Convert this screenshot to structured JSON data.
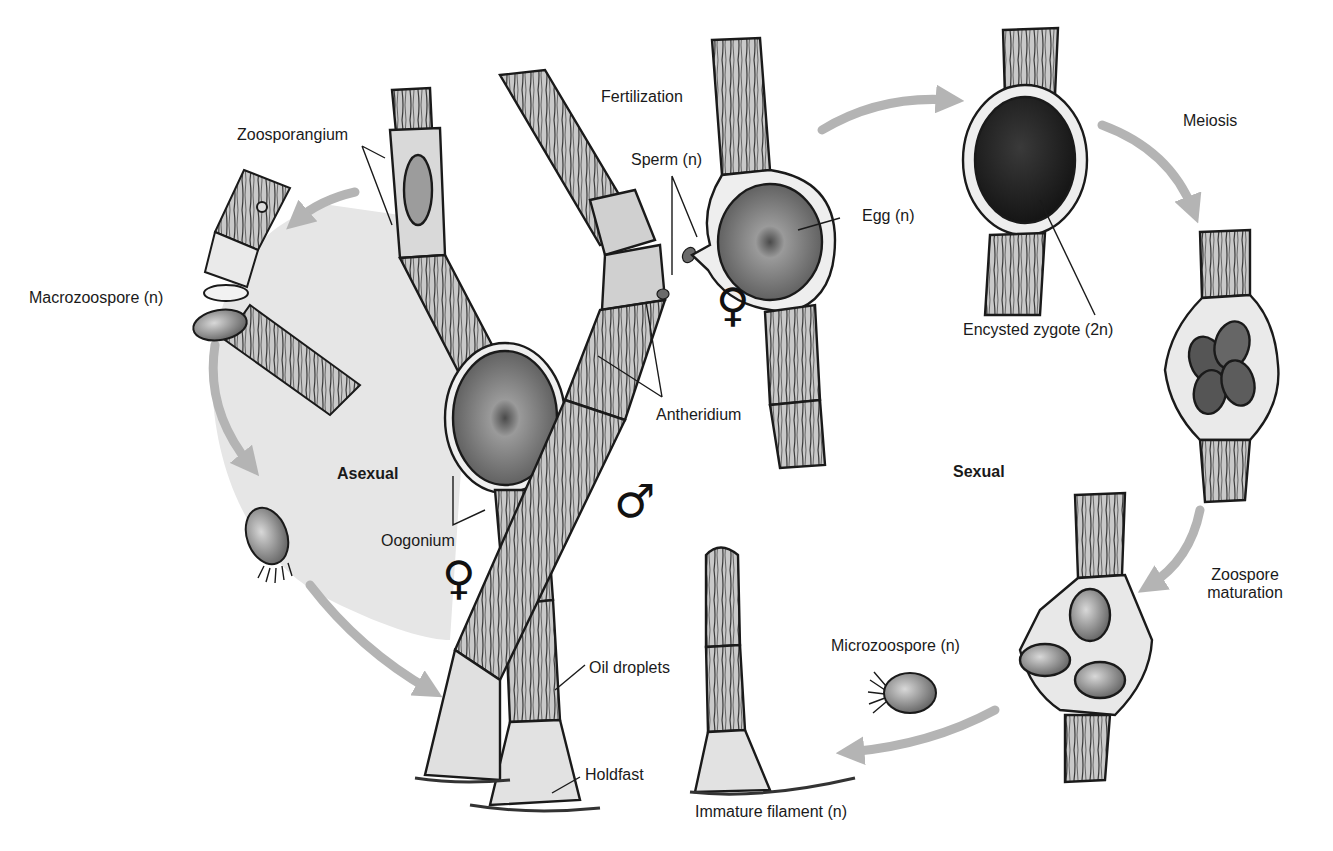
{
  "diagram": {
    "type": "life-cycle",
    "phases": {
      "asexual": "Asexual",
      "sexual": "Sexual"
    },
    "labels": {
      "zoosporangium": "Zoosporangium",
      "macrozoospore": "Macrozoospore (n)",
      "fertilization": "Fertilization",
      "sperm": "Sperm (n)",
      "egg": "Egg (n)",
      "antheridium": "Antheridium",
      "oogonium": "Oogonium",
      "meiosis": "Meiosis",
      "encysted_zygote": "Encysted zygote (2n)",
      "zoospore_maturation_line1": "Zoospore",
      "zoospore_maturation_line2": "maturation",
      "microzoospore": "Microzoospore (n)",
      "oil_droplets": "Oil droplets",
      "holdfast": "Holdfast",
      "immature_filament": "Immature filament (n)"
    },
    "symbols": {
      "female_1": "♀",
      "female_2": "♀",
      "male": "♂"
    },
    "colors": {
      "arrow": "#b4b4b4",
      "asexual_bg": "#e6e6e6",
      "ink": "#1a1a1a",
      "cell_fill": "#cfcfcf",
      "zygote_fill": "#2e2e2e"
    }
  }
}
